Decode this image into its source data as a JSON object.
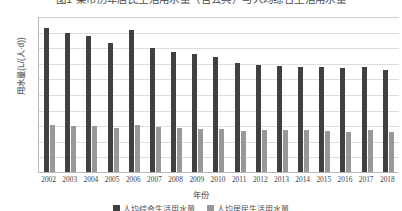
{
  "chart_data": {
    "type": "bar",
    "title": "图1 某市历年居民生活用水量（含公共）与人均综合生活用水量",
    "xlabel": "年份",
    "ylabel": "用水量(L/(人·d))",
    "ylim": [
      0,
      500
    ],
    "yticks": [
      0,
      50,
      100,
      150,
      200,
      250,
      300,
      350,
      400,
      450,
      500
    ],
    "grid": true,
    "legend_position": "bottom",
    "categories": [
      "2002",
      "2003",
      "2004",
      "2005",
      "2006",
      "2007",
      "2008",
      "2009",
      "2010",
      "2011",
      "2012",
      "2013",
      "2014",
      "2015",
      "2016",
      "2017",
      "2018"
    ],
    "series": [
      {
        "name": "人均综合生活用水量",
        "color": "#404040",
        "values": [
          465,
          450,
          440,
          415,
          458,
          400,
          388,
          382,
          370,
          352,
          345,
          342,
          340,
          338,
          336,
          340,
          330
        ]
      },
      {
        "name": "人均居民生活用水量",
        "color": "#989898",
        "values": [
          152,
          150,
          150,
          143,
          152,
          145,
          142,
          140,
          138,
          132,
          134,
          135,
          136,
          133,
          130,
          134,
          128
        ]
      }
    ]
  }
}
